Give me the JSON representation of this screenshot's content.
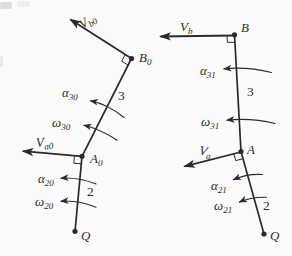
{
  "colors": {
    "ink": "#2b2b2b",
    "background": "#fbfbf9",
    "smudge": "#c9c9c9"
  },
  "left": {
    "vb0": {
      "base": "V",
      "sub": "b0"
    },
    "va0": {
      "base": "V",
      "sub": "a0"
    },
    "alpha30": {
      "base": "α",
      "sub": "30"
    },
    "omega30": {
      "base": "ω",
      "sub": "30"
    },
    "alpha20": {
      "base": "α",
      "sub": "20"
    },
    "omega20": {
      "base": "ω",
      "sub": "20"
    },
    "link3_label": "3",
    "link2_label": "2",
    "point_B0": {
      "base": "B",
      "sub": "0"
    },
    "point_A0": {
      "base": "A",
      "sub": "0"
    },
    "point_Q": "Q"
  },
  "right": {
    "vb": {
      "base": "V",
      "sub": "b"
    },
    "va": {
      "base": "V",
      "sub": "a"
    },
    "alpha31": {
      "base": "α",
      "sub": "31"
    },
    "omega31": {
      "base": "ω",
      "sub": "31"
    },
    "alpha21": {
      "base": "α",
      "sub": "21"
    },
    "omega21": {
      "base": "ω",
      "sub": "21"
    },
    "link3_label": "3",
    "link2_label": "2",
    "point_B": "B",
    "point_A": "A",
    "point_Q": "Q"
  }
}
